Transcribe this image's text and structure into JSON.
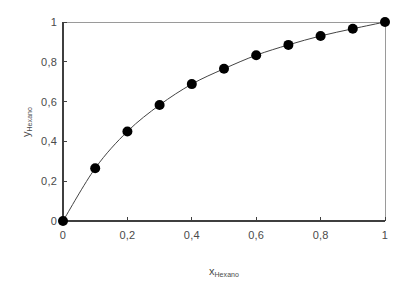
{
  "chart_data": {
    "type": "scatter",
    "title": "",
    "subtitle": "",
    "xlabel_main": "x",
    "xlabel_sub": "Hexano",
    "ylabel_main": "y",
    "ylabel_sub": "Hexano",
    "xlim": [
      0,
      1
    ],
    "ylim": [
      0,
      1
    ],
    "grid": false,
    "legend": "none",
    "decimal_separator": ",",
    "marker_style": "filled-circle",
    "marker_color": "#000000",
    "line_color": "#444444",
    "axis_color": "#3f3f3f",
    "frame_color": "#9a9a9a",
    "xticks": [
      0,
      0.2,
      0.4,
      0.6,
      0.8,
      1
    ],
    "xtick_labels": [
      "0",
      "0,2",
      "0,4",
      "0,6",
      "0,8",
      "1"
    ],
    "yticks": [
      0,
      0.2,
      0.4,
      0.6,
      0.8,
      1
    ],
    "ytick_labels": [
      "0",
      "0,2",
      "0,4",
      "0,6",
      "0,8",
      "1"
    ],
    "x": [
      0,
      0.1,
      0.2,
      0.3,
      0.4,
      0.5,
      0.6,
      0.7,
      0.8,
      0.9,
      1
    ],
    "values": [
      0,
      0.265,
      0.45,
      0.583,
      0.688,
      0.765,
      0.833,
      0.885,
      0.93,
      0.966,
      1
    ],
    "series": [
      {
        "name": "Hexano",
        "x": [
          0,
          0.1,
          0.2,
          0.3,
          0.4,
          0.5,
          0.6,
          0.7,
          0.8,
          0.9,
          1
        ],
        "values": [
          0,
          0.265,
          0.45,
          0.583,
          0.688,
          0.765,
          0.833,
          0.885,
          0.93,
          0.966,
          1
        ]
      }
    ]
  },
  "layout": {
    "plot_left": 63,
    "plot_right": 385,
    "plot_top": 22,
    "plot_bottom": 221,
    "marker_radius": 5.0,
    "line_width": 1.0,
    "tick_length": 4
  }
}
